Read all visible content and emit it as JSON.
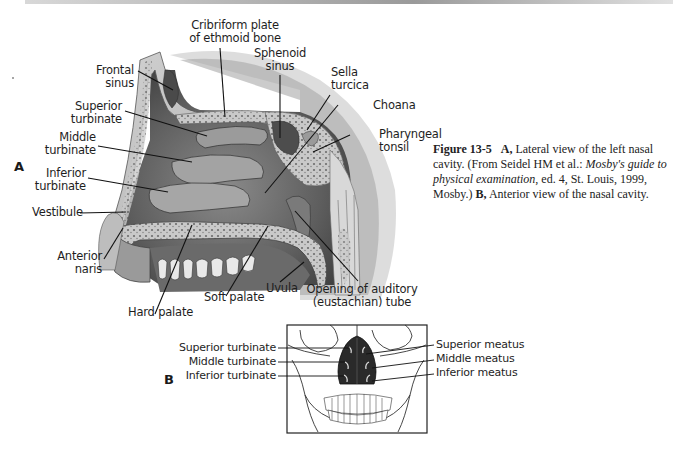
{
  "figure": {
    "number": "Figure 13-5",
    "panel_a_letter": "A",
    "panel_b_letter": "B",
    "caption": {
      "a_label": "A,",
      "a_text_1": "Lateral view of the left nasal cavity. (From Seidel HM et al.:",
      "a_source_title": "Mosby's guide to physical examination",
      "a_text_2": ", ed. 4, St. Louis, 1999, Mosby.)",
      "b_label": "B,",
      "b_text": "Anterior view of the nasal cavity."
    }
  },
  "panel_a": {
    "labels": {
      "cribriform_1": "Cribriform plate",
      "cribriform_2": "of ethmoid bone",
      "sphenoid_1": "Sphenoid",
      "sphenoid_2": "sinus",
      "frontal_1": "Frontal",
      "frontal_2": "sinus",
      "sella_1": "Sella",
      "sella_2": "turcica",
      "choana": "Choana",
      "superior_turbinate_1": "Superior",
      "superior_turbinate_2": "turbinate",
      "pharyngeal_1": "Pharyngeal",
      "pharyngeal_2": "tonsil",
      "middle_turbinate_1": "Middle",
      "middle_turbinate_2": "turbinate",
      "inferior_turbinate_1": "Inferior",
      "inferior_turbinate_2": "turbinate",
      "vestibule": "Vestibule",
      "anterior_naris_1": "Anterior",
      "anterior_naris_2": "naris",
      "uvula": "Uvula",
      "soft_palate": "Soft palate",
      "hard_palate": "Hard palate",
      "auditory_1": "Opening of auditory",
      "auditory_2": "(eustachian) tube"
    }
  },
  "panel_b": {
    "left_labels": [
      "Superior turbinate",
      "Middle turbinate",
      "Inferior turbinate"
    ],
    "right_labels": [
      "Superior meatus",
      "Middle meatus",
      "Inferior meatus"
    ]
  }
}
